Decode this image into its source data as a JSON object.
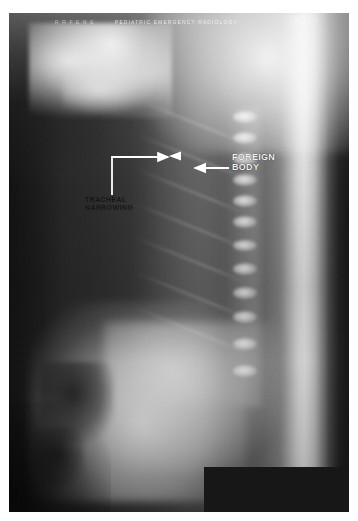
{
  "figure": {
    "modality": "x-ray-radiograph",
    "view": "lateral chest / upper airway",
    "film": {
      "left": 9,
      "top": 13,
      "width": 340,
      "height": 499,
      "background_color": "#2a2a2a",
      "border_color": "#ffffff"
    }
  },
  "header": {
    "left_marking": "R R F E R E",
    "mid_marking": "PEDIATRIC EMERGENCY RADIOLOGY",
    "right_marking": "H  3 5 7"
  },
  "annotations": [
    {
      "id": "foreign-body",
      "label": "FOREIGN\nBODY",
      "color": "#f2f2f2",
      "label_x": 232,
      "label_y": 152,
      "arrow": {
        "type": "line-arrow",
        "direction": "left",
        "x1": 228,
        "y1": 168,
        "x2": 192,
        "y2": 168,
        "color": "#ffffff",
        "stroke": 2
      }
    },
    {
      "id": "tracheal-narrowing",
      "label": "TRACHEAL\nNARROWING",
      "color": "#141414",
      "label_x": 85,
      "label_y": 196,
      "arrow": {
        "type": "elbow-arrow",
        "direction": "right",
        "stem_x": 112,
        "stem_y1": 195,
        "stem_y2": 157,
        "head_x": 172,
        "head_y": 157,
        "color": "#ffffff",
        "stroke": 2
      }
    },
    {
      "id": "airway-marker",
      "label": "",
      "arrow": {
        "type": "arrowhead",
        "direction": "left",
        "tip_x": 170,
        "tip_y": 156,
        "size": 9,
        "color": "#ffffff"
      }
    }
  ],
  "regions": {
    "black_block": {
      "name": "collimation-block",
      "left": 204,
      "top": 467,
      "width": 145,
      "height": 45,
      "color": "#151515"
    },
    "bright_band": {
      "name": "posterior-soft-tissue-band",
      "center_x": 302
    },
    "spine": {
      "name": "vertebral-column",
      "vertebra_count": 12
    },
    "diaphragm": {
      "name": "diaphragm-dome"
    },
    "jaw": {
      "name": "mandible-skull-base"
    }
  },
  "colors": {
    "film_dark": "#1f1f1f",
    "film_mid": "#4e4e4e",
    "film_bright": "#c9c9c9",
    "annotation_white": "#ffffff",
    "annotation_dark": "#141414",
    "page_background": "#ffffff"
  }
}
